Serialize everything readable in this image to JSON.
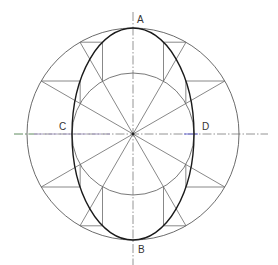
{
  "diagram": {
    "type": "geometric-construction",
    "labels": {
      "A": "A",
      "B": "B",
      "C": "C",
      "D": "D"
    },
    "geometry": {
      "center": [
        133,
        134
      ],
      "outer_circle_radius": 106,
      "inner_circle_radius": 61,
      "ellipse_rx": 61,
      "ellipse_ry": 106,
      "ray_count": 12,
      "ray_step_degrees": 30,
      "major_axis": "vertical (A-B)",
      "minor_axis": "horizontal (C-D)"
    },
    "colors": {
      "background": "#ffffff",
      "ellipse": "#1a1a1a",
      "construction": "#6a6a6a",
      "centerline": "#7a7a7a",
      "centerline_green_tint": "#8fbf8f",
      "centerline_purple_tint": "#9a8fb8",
      "centerline_blue_tint": "#5a5ad0",
      "label": "#333333"
    }
  }
}
